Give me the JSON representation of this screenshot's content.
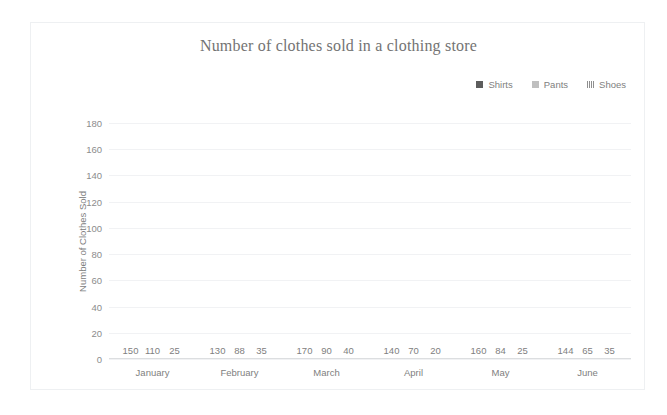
{
  "chart_data": {
    "type": "bar",
    "title": "Number of clothes sold in a clothing store",
    "xlabel": "",
    "ylabel": "Number of Clothes Sold",
    "ylim": [
      0,
      180
    ],
    "ytick_step": 20,
    "yticks": [
      "180",
      "160",
      "140",
      "120",
      "100",
      "80",
      "60",
      "40",
      "20",
      "0"
    ],
    "grid": true,
    "legend_position": "top-right",
    "categories": [
      "January",
      "February",
      "March",
      "April",
      "May",
      "June"
    ],
    "series": [
      {
        "name": "Shirts",
        "color": "#5d5d5d",
        "pattern": "solid",
        "values": [
          150,
          130,
          170,
          140,
          160,
          144
        ]
      },
      {
        "name": "Pants",
        "color": "#bfbfbf",
        "pattern": "solid",
        "values": [
          110,
          88,
          90,
          70,
          84,
          65
        ]
      },
      {
        "name": "Shoes",
        "color": "#8f8f8f",
        "pattern": "hatch",
        "values": [
          25,
          35,
          40,
          20,
          25,
          35
        ]
      }
    ]
  },
  "legend": {
    "items": [
      {
        "label": "Shirts",
        "swatch": "square-dark-icon"
      },
      {
        "label": "Pants",
        "swatch": "square-light-icon"
      },
      {
        "label": "Shoes",
        "swatch": "square-hatch-icon"
      }
    ]
  }
}
